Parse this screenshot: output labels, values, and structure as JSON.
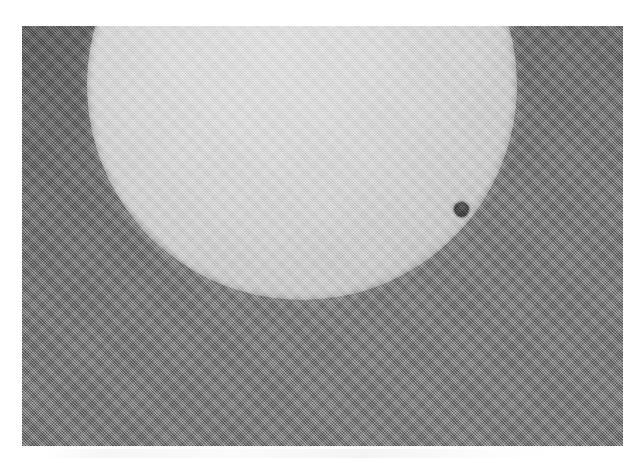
{
  "page": {
    "background_color": "#ffffff",
    "width": 637,
    "height": 463
  },
  "photo": {
    "name": "solar-transit-photograph",
    "description": "Grainy halftone-printed photograph of the Sun's disk with a small dark round planet silhouette near the lower-right limb",
    "frame": {
      "x": 22,
      "y": 26,
      "width": 601,
      "height": 420
    },
    "sky": {
      "label": "sky-background",
      "color": "#7a7a7a",
      "corner_dark_color": "#6c6c6c"
    },
    "solar_disk": {
      "label": "solar-disk",
      "center_x": 302,
      "center_y": 85,
      "radius": 215,
      "fill_color": "#d8d8d8",
      "limb_color": "#b8b8b8"
    },
    "planet": {
      "label": "planet-silhouette",
      "center_x": 461,
      "center_y": 209,
      "radius": 7,
      "fill_color": "#4a4a4a"
    },
    "texture": {
      "label": "halftone-dither",
      "pattern": "45-degree crosshatch halftone screen"
    }
  },
  "caption": {
    "text": ""
  }
}
